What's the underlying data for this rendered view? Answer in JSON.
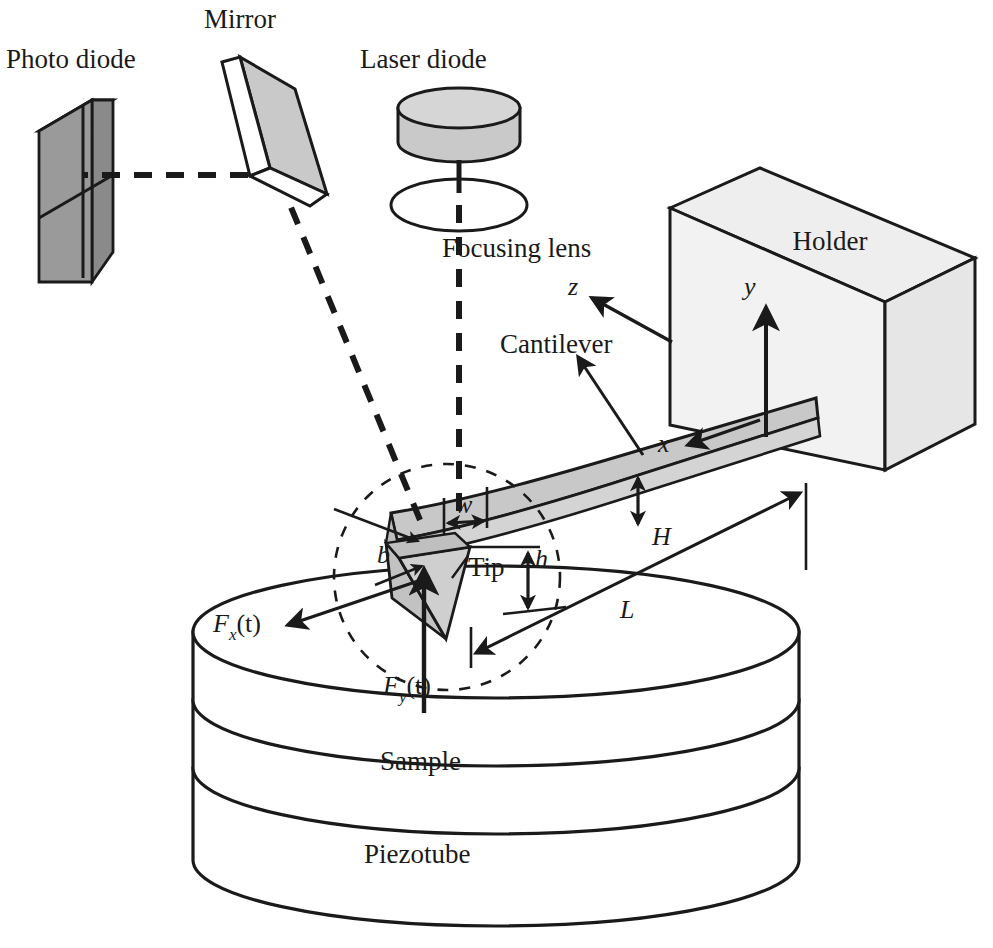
{
  "figure": {
    "background_color": "#ffffff",
    "line_color": "#1a1a1a"
  },
  "colors": {
    "photodiode_face": "#9a9a9a",
    "photodiode_top": "#b4b4b4",
    "photodiode_side": "#8c8c8c",
    "mirror_face": "#c9c9c9",
    "mirror_edge": "#ffffff",
    "laser_body": "#c9c9c9",
    "laser_top": "#d8d8d8",
    "lens_fill": "#ffffff",
    "holder_front": "#f0f0f0",
    "holder_top": "#e8e8e8",
    "holder_side": "#e0e0e0",
    "cantilever": "#c8c8c8",
    "cantilever_edge": "#d4d4d4",
    "tip": "#c2c2c2",
    "cylinder_fill": "#ffffff",
    "outline": "#1a1a1a"
  },
  "labels": {
    "photo_diode": "Photo diode",
    "mirror": "Mirror",
    "laser_diode": "Laser diode",
    "focusing_lens": "Focusing lens",
    "holder": "Holder",
    "cantilever": "Cantilever",
    "tip": "Tip",
    "sample": "Sample",
    "piezotube": "Piezotube"
  },
  "axes": [
    {
      "name": "z",
      "label": "z",
      "direction": "up-left"
    },
    {
      "name": "y",
      "label": "y",
      "direction": "up"
    },
    {
      "name": "x",
      "label": "x",
      "direction": "left"
    }
  ],
  "dimensions": [
    {
      "name": "w",
      "label": "w",
      "meaning": "cantilever width"
    },
    {
      "name": "b",
      "label": "b",
      "meaning": "tip base width"
    },
    {
      "name": "h",
      "label": "h",
      "meaning": "tip height"
    },
    {
      "name": "H",
      "label": "H",
      "meaning": "cantilever thickness"
    },
    {
      "name": "L",
      "label": "L",
      "meaning": "cantilever length"
    }
  ],
  "forces": [
    {
      "name": "Fx",
      "base": "F",
      "sub": "x",
      "arg": "(t)",
      "full": "Fx(t)",
      "direction": "lateral"
    },
    {
      "name": "Fy",
      "base": "F",
      "sub": "y",
      "arg": "(t)",
      "full": "Fy(t)",
      "direction": "vertical"
    }
  ],
  "components": [
    {
      "name": "photo-diode",
      "kind": "quadrant-detector-box"
    },
    {
      "name": "mirror",
      "kind": "tilted-plate"
    },
    {
      "name": "laser-diode",
      "kind": "cylinder"
    },
    {
      "name": "focusing-lens",
      "kind": "ellipse"
    },
    {
      "name": "holder",
      "kind": "box"
    },
    {
      "name": "cantilever",
      "kind": "curved-beam"
    },
    {
      "name": "tip",
      "kind": "pyramid"
    },
    {
      "name": "sample",
      "kind": "cylinder-layer"
    },
    {
      "name": "piezotube",
      "kind": "cylinder-layer"
    },
    {
      "name": "laser-beam",
      "kind": "dashed-path"
    },
    {
      "name": "magnifier-circle",
      "kind": "dashed-circle"
    }
  ]
}
